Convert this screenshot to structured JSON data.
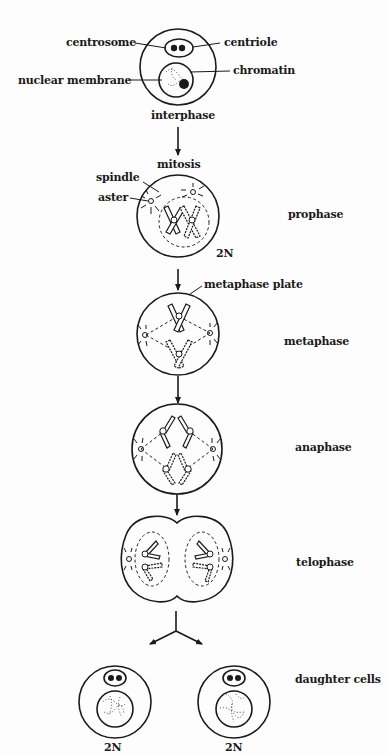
{
  "diagram": {
    "labels": {
      "centrosome": "centrosome",
      "centriole": "centriole",
      "nuclear_membrane": "nuclear membrane",
      "chromatin": "chromatin",
      "interphase": "interphase",
      "mitosis": "mitosis",
      "spindle": "spindle",
      "aster": "aster",
      "metaphase_plate": "metaphase plate",
      "prophase_ploidy": "2N",
      "daughter_left_ploidy": "2N",
      "daughter_right_ploidy": "2N"
    },
    "stages": [
      {
        "name": "prophase"
      },
      {
        "name": "metaphase"
      },
      {
        "name": "anaphase"
      },
      {
        "name": "telophase"
      },
      {
        "name": "daughter cells"
      }
    ],
    "colors": {
      "ink": "#1a1a1a",
      "background": "#fdfdfd"
    }
  }
}
